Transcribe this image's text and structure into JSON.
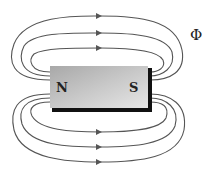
{
  "diagram": {
    "magnet": {
      "north_label": "N",
      "south_label": "S",
      "body_color_light": "#e4e4e4",
      "body_color_dark": "#9a9a9a",
      "shadow_color": "#111111"
    },
    "flux_symbol": "Φ",
    "field_lines": {
      "color": "#555555",
      "count_top": 3,
      "count_bottom": 3,
      "arrow_direction": "right"
    }
  }
}
